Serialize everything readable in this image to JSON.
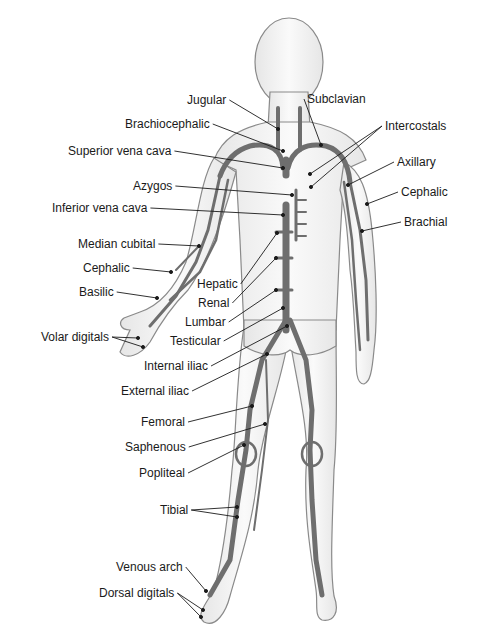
{
  "diagram": {
    "labels_left": [
      {
        "id": "jugular",
        "text": "Jugular",
        "x": 187,
        "y": 100,
        "ax": 278,
        "ay": 129
      },
      {
        "id": "brachiocephalic",
        "text": "Brachiocephalic",
        "x": 125,
        "y": 124,
        "ax": 283,
        "ay": 151
      },
      {
        "id": "superior-vena-cava",
        "text": "Superior vena cava",
        "x": 68,
        "y": 151,
        "ax": 283,
        "ay": 168
      },
      {
        "id": "azygos",
        "text": "Azygos",
        "x": 133,
        "y": 186,
        "ax": 292,
        "ay": 195
      },
      {
        "id": "inferior-vena-cava",
        "text": "Inferior vena cava",
        "x": 52,
        "y": 208,
        "ax": 283,
        "ay": 215
      },
      {
        "id": "median-cubital",
        "text": "Median cubital",
        "x": 78,
        "y": 244,
        "ax": 199,
        "ay": 246
      },
      {
        "id": "cephalic-left",
        "text": "Cephalic",
        "x": 83,
        "y": 268,
        "ax": 171,
        "ay": 272
      },
      {
        "id": "basilic",
        "text": "Basilic",
        "x": 79,
        "y": 292,
        "ax": 157,
        "ay": 298
      },
      {
        "id": "volar-digitals",
        "text": "Volar digitals",
        "x": 41,
        "y": 337,
        "ax": 138,
        "ay": 338
      },
      {
        "id": "hepatic",
        "text": "Hepatic",
        "x": 197,
        "y": 284,
        "ax": 277,
        "ay": 233
      },
      {
        "id": "renal",
        "text": "Renal",
        "x": 198,
        "y": 303,
        "ax": 276,
        "ay": 258
      },
      {
        "id": "lumbar",
        "text": "Lumbar",
        "x": 185,
        "y": 322,
        "ax": 276,
        "ay": 290
      },
      {
        "id": "testicular",
        "text": "Testicular",
        "x": 170,
        "y": 341,
        "ax": 283,
        "ay": 308
      },
      {
        "id": "internal-iliac",
        "text": "Internal iliac",
        "x": 144,
        "y": 366,
        "ax": 287,
        "ay": 326
      },
      {
        "id": "external-iliac",
        "text": "External iliac",
        "x": 121,
        "y": 391,
        "ax": 267,
        "ay": 354
      },
      {
        "id": "femoral",
        "text": "Femoral",
        "x": 141,
        "y": 422,
        "ax": 252,
        "ay": 406
      },
      {
        "id": "saphenous",
        "text": "Saphenous",
        "x": 125,
        "y": 447,
        "ax": 265,
        "ay": 424
      },
      {
        "id": "popliteal",
        "text": "Popliteal",
        "x": 139,
        "y": 473,
        "ax": 244,
        "ay": 445
      },
      {
        "id": "tibial",
        "text": "Tibial",
        "x": 160,
        "y": 510,
        "ax": 237,
        "ay": 507
      },
      {
        "id": "venous-arch",
        "text": "Venous arch",
        "x": 116,
        "y": 567,
        "ax": 206,
        "ay": 591
      },
      {
        "id": "dorsal-digitals",
        "text": "Dorsal digitals",
        "x": 99,
        "y": 593,
        "ax": 203,
        "ay": 610
      }
    ],
    "labels_right": [
      {
        "id": "subclavian",
        "text": "Subclavian",
        "x": 307,
        "y": 99,
        "ax": 321,
        "ay": 145
      },
      {
        "id": "intercostals",
        "text": "Intercostals",
        "x": 385,
        "y": 126,
        "ax": 310,
        "ay": 174
      },
      {
        "id": "axillary",
        "text": "Axillary",
        "x": 397,
        "y": 162,
        "ax": 348,
        "ay": 185
      },
      {
        "id": "cephalic-right",
        "text": "Cephalic",
        "x": 401,
        "y": 192,
        "ax": 367,
        "ay": 204
      },
      {
        "id": "brachial",
        "text": "Brachial",
        "x": 404,
        "y": 222,
        "ax": 362,
        "ay": 231
      }
    ],
    "extra_leaders": [
      {
        "for": "intercostals",
        "ax": 311,
        "ay": 187
      },
      {
        "for": "volar-digitals",
        "ax": 143,
        "ay": 347
      },
      {
        "for": "tibial",
        "ax": 237,
        "ay": 517
      },
      {
        "for": "dorsal-digitals",
        "ax": 201,
        "ay": 617
      }
    ],
    "colors": {
      "body_fill": "#f2f2f2",
      "body_outline": "#8a8a8a",
      "vein": "#6e6e6e",
      "vein_dark": "#4a4a4a",
      "leader": "#1a1a1a",
      "text": "#1a1a1a"
    }
  }
}
